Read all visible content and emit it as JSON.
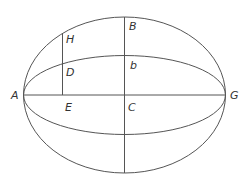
{
  "diagram": {
    "labels": {
      "A": "A",
      "G": "G",
      "B": "B",
      "b": "b",
      "C": "C",
      "H": "H",
      "D": "D",
      "E": "E"
    },
    "stroke_color": "#555555",
    "label_color": "#333333"
  }
}
